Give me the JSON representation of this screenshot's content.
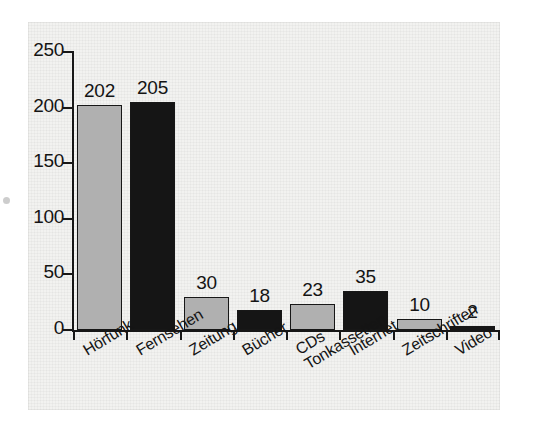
{
  "figure": {
    "background_color": "#f2f2f0",
    "ink_color": "#171717",
    "bar_gray_color": "#b0b0b0",
    "bar_black_color": "#151515"
  },
  "axis": {
    "y_ticks": [
      "250",
      "200",
      "150",
      "100",
      "50",
      "0"
    ],
    "y_tick_values": [
      250,
      200,
      150,
      100,
      50,
      0
    ]
  },
  "chart_data": {
    "type": "bar",
    "title": "",
    "subtitle": "",
    "xlabel": "",
    "ylabel": "",
    "ylim": [
      0,
      250
    ],
    "grid": false,
    "legend": "none",
    "categories": [
      "Hörfunk",
      "Fernsehen",
      "Zeitung",
      "Bücher",
      "CDs\nTonkassetten",
      "Internet",
      "Zeitschriften",
      "Video"
    ],
    "values": [
      202,
      205,
      30,
      18,
      23,
      35,
      10,
      2
    ],
    "value_labels": [
      "202",
      "205",
      "30",
      "18",
      "23",
      "35",
      "10",
      "2"
    ],
    "bar_colors": [
      "#b0b0b0",
      "#151515",
      "#b0b0b0",
      "#151515",
      "#b0b0b0",
      "#151515",
      "#b0b0b0",
      "#151515"
    ],
    "yticks": [
      0,
      50,
      100,
      150,
      200,
      250
    ],
    "ytick_labels": [
      "0",
      "50",
      "100",
      "150",
      "200",
      "250"
    ]
  }
}
